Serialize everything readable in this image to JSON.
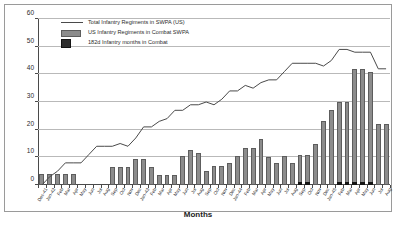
{
  "chart_data": {
    "type": "bar",
    "title": "",
    "xlabel": "Months",
    "ylabel": "",
    "ylim": [
      0,
      60
    ],
    "ytick_values": [
      0,
      10,
      20,
      30,
      40,
      50,
      60
    ],
    "grid": true,
    "legend_position": "top-left",
    "categories": [
      "Dec-41",
      "Jan-42",
      "Feb",
      "Mar",
      "Apr",
      "May",
      "Jun",
      "Jul",
      "Aug",
      "Sep",
      "Oct",
      "Nov",
      "Dec",
      "Jan-43",
      "Feb",
      "Mar",
      "Apr",
      "May",
      "Jun",
      "Jul",
      "Aug",
      "Sep",
      "Oct",
      "Nov",
      "Dec",
      "Jan-44",
      "Feb",
      "Mar",
      "Apr",
      "May",
      "Jun",
      "Jul",
      "Aug",
      "Sep",
      "Oct",
      "Nov",
      "Dec",
      "Jan-45",
      "Feb",
      "Mar",
      "Apr",
      "May",
      "Jun",
      "Jul",
      "Aug"
    ],
    "series": [
      {
        "name": "Total Infantry Regiments in SWPA (US)",
        "type": "line",
        "color": "#4a4a4a",
        "values": [
          0,
          3,
          5,
          8,
          8,
          8,
          11,
          14,
          14,
          14,
          15,
          14,
          17,
          21,
          21,
          23,
          24,
          27,
          27,
          29,
          29,
          30,
          29,
          31,
          34,
          34,
          36,
          35,
          37,
          38,
          38,
          41,
          44,
          44,
          44,
          44,
          43,
          45,
          49,
          49,
          48,
          48,
          48,
          42,
          42
        ]
      },
      {
        "name": "US Infantry  Regiments in Combat SWPA",
        "type": "bar",
        "color": "#8c8c8c",
        "values": [
          4,
          4,
          4,
          4,
          4,
          0,
          0,
          0,
          0,
          6.5,
          6.5,
          6.5,
          9.5,
          9.5,
          6.5,
          3.5,
          3.5,
          3.5,
          10.5,
          12.5,
          11.5,
          5,
          7,
          7,
          8,
          10.5,
          13.5,
          13.5,
          16.5,
          10,
          8,
          10.5,
          8,
          11,
          11,
          15,
          23,
          27,
          30,
          30,
          42,
          42,
          41,
          22,
          22
        ]
      },
      {
        "name": "182d Infantry months in Combat",
        "type": "bar",
        "color": "#141414",
        "values": [
          0,
          0,
          0,
          0,
          0,
          0,
          0,
          0,
          0,
          0,
          0,
          0,
          0,
          0,
          0,
          0,
          0,
          0,
          0,
          0,
          0,
          0,
          0,
          0,
          0,
          0,
          0,
          0,
          0,
          0,
          0,
          0,
          0,
          1.2,
          1.2,
          0,
          0,
          0,
          1.2,
          1.2,
          1.2,
          1.2,
          1.2,
          0,
          0
        ]
      }
    ]
  },
  "legend": {
    "items": [
      {
        "label": "Total Infantry Regiments in SWPA (US)",
        "key": "line-key-icon"
      },
      {
        "label": "US Infantry  Regiments in Combat SWPA",
        "key": "hatched-swatch-icon"
      },
      {
        "label": "182d Infantry months in Combat",
        "key": "dark-swatch-icon"
      }
    ]
  },
  "axis": {
    "x_title": "Months"
  }
}
